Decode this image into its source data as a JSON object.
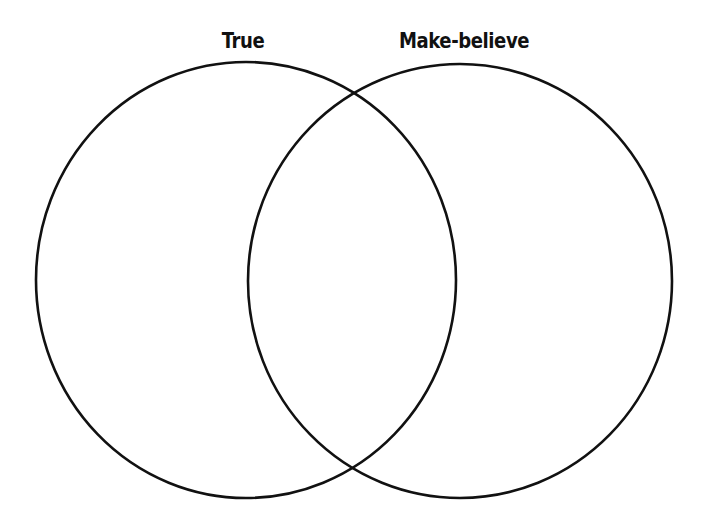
{
  "diagram": {
    "type": "venn",
    "background": "#ffffff",
    "stroke_color": "#111111",
    "sets": [
      {
        "label": "True",
        "cx": 246,
        "cy": 280,
        "rx": 210,
        "ry": 218
      },
      {
        "label": "Make-believe",
        "cx": 460,
        "cy": 281,
        "rx": 212,
        "ry": 217
      }
    ],
    "intersection_label": ""
  }
}
